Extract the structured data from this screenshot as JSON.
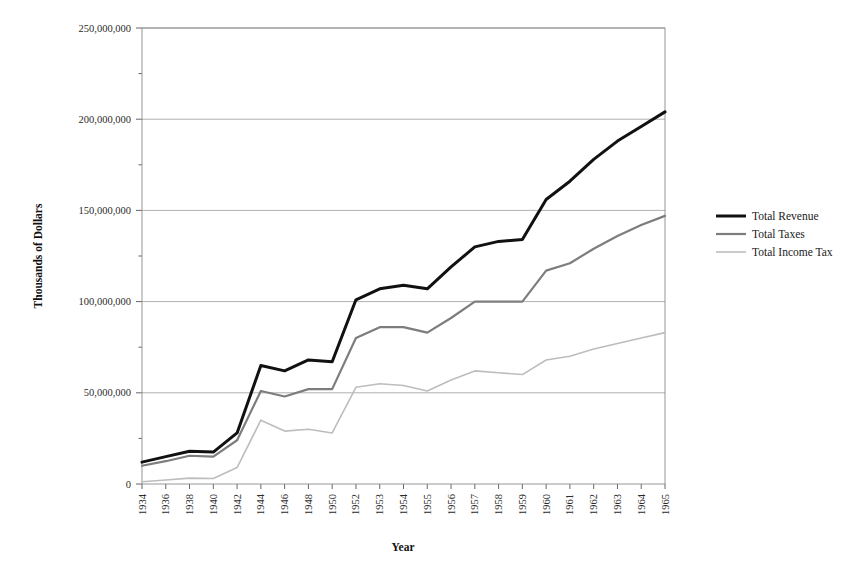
{
  "chart_data": {
    "type": "line",
    "title": "",
    "xlabel": "Year",
    "ylabel": "Thousands of Dollars",
    "ylim": [
      0,
      250000000
    ],
    "ytick_labels": [
      "0",
      "50,000,000",
      "100,000,000",
      "150,000,000",
      "200,000,000",
      "250,000,000"
    ],
    "ytick_values": [
      0,
      50000000,
      100000000,
      150000000,
      200000000,
      250000000
    ],
    "grid": true,
    "legend_position": "right",
    "categories": [
      "1934",
      "1936",
      "1938",
      "1940",
      "1942",
      "1944",
      "1946",
      "1948",
      "1950",
      "1952",
      "1953",
      "1954",
      "1955",
      "1956",
      "1957",
      "1958",
      "1959",
      "1960",
      "1961",
      "1962",
      "1963",
      "1964",
      "1965"
    ],
    "series": [
      {
        "name": "Total Revenue",
        "color": "#111111",
        "width": 3.0,
        "values": [
          12000000,
          15000000,
          18000000,
          17500000,
          28000000,
          65000000,
          62000000,
          68000000,
          67000000,
          101000000,
          107000000,
          109000000,
          107000000,
          119000000,
          130000000,
          133000000,
          134000000,
          156000000,
          166000000,
          178000000,
          188000000,
          196000000,
          204000000
        ]
      },
      {
        "name": "Total Taxes",
        "color": "#7d7d7d",
        "width": 2.2,
        "values": [
          10000000,
          12500000,
          15500000,
          15000000,
          24000000,
          51000000,
          48000000,
          52000000,
          52000000,
          80000000,
          86000000,
          86000000,
          83000000,
          91000000,
          100000000,
          100000000,
          100000000,
          117000000,
          121000000,
          129000000,
          136000000,
          142000000,
          147000000
        ]
      },
      {
        "name": "Total Income Tax",
        "color": "#bdbdbd",
        "width": 1.6,
        "values": [
          1200000,
          2200000,
          3200000,
          3000000,
          9000000,
          35000000,
          29000000,
          30000000,
          28000000,
          53000000,
          55000000,
          54000000,
          51000000,
          57000000,
          62000000,
          61000000,
          60000000,
          68000000,
          70000000,
          74000000,
          77000000,
          80000000,
          83000000
        ]
      }
    ],
    "legend": [
      {
        "label": "Total Revenue",
        "color": "#111111",
        "width": 3.0
      },
      {
        "label": "Total Taxes",
        "color": "#7d7d7d",
        "width": 2.2
      },
      {
        "label": "Total Income Tax",
        "color": "#bdbdbd",
        "width": 1.6
      }
    ]
  },
  "plot": {
    "left": 142,
    "right": 665,
    "top": 28,
    "bottom": 484,
    "legend_x": 716,
    "legend_y": 216,
    "legend_row_gap": 18,
    "legend_swatch_width": 30,
    "ylabel_x": 42,
    "ylabel_y": 256,
    "xlabel_x": 403,
    "xlabel_y": 551
  }
}
